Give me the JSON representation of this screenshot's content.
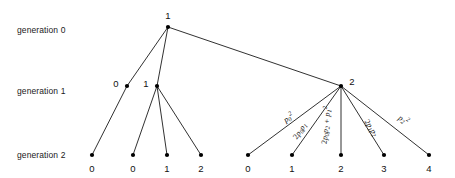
{
  "figure": {
    "background_color": "#ffffff",
    "line_color": "#1a1a1a",
    "node_color": "#000000",
    "text_color": "#111111",
    "width": 455,
    "height": 178
  },
  "generation_labels": [
    {
      "text": "generation 0",
      "x": 17,
      "y": 30
    },
    {
      "text": "generation 1",
      "x": 17,
      "y": 91
    },
    {
      "text": "generation 2",
      "x": 17,
      "y": 155
    }
  ],
  "nodes": [
    {
      "id": "g0n0",
      "label": "1",
      "x": 168,
      "y": 27,
      "label_x": 168,
      "label_y": 15,
      "generation": 0
    },
    {
      "id": "g1n0",
      "label": "0",
      "x": 127,
      "y": 86,
      "label_x": 116,
      "label_y": 83,
      "generation": 1
    },
    {
      "id": "g1n1",
      "label": "1",
      "x": 157,
      "y": 86,
      "label_x": 146,
      "label_y": 83,
      "generation": 1
    },
    {
      "id": "g1n2",
      "label": "2",
      "x": 341,
      "y": 86,
      "label_x": 352,
      "label_y": 81,
      "generation": 1
    },
    {
      "id": "g2n0",
      "label": "0",
      "x": 92,
      "y": 155,
      "label_x": 92,
      "label_y": 168,
      "generation": 2
    },
    {
      "id": "g2n1",
      "label": "0",
      "x": 133,
      "y": 155,
      "label_x": 133,
      "label_y": 168,
      "generation": 2
    },
    {
      "id": "g2n2",
      "label": "1",
      "x": 167,
      "y": 155,
      "label_x": 167,
      "label_y": 168,
      "generation": 2
    },
    {
      "id": "g2n3",
      "label": "2",
      "x": 201,
      "y": 155,
      "label_x": 201,
      "label_y": 168,
      "generation": 2
    },
    {
      "id": "g2n4",
      "label": "0",
      "x": 248,
      "y": 155,
      "label_x": 248,
      "label_y": 168,
      "generation": 2
    },
    {
      "id": "g2n5",
      "label": "1",
      "x": 292,
      "y": 155,
      "label_x": 292,
      "label_y": 168,
      "generation": 2
    },
    {
      "id": "g2n6",
      "label": "2",
      "x": 341,
      "y": 155,
      "label_x": 341,
      "label_y": 168,
      "generation": 2
    },
    {
      "id": "g2n7",
      "label": "3",
      "x": 384,
      "y": 155,
      "label_x": 384,
      "label_y": 168,
      "generation": 2
    },
    {
      "id": "g2n8",
      "label": "4",
      "x": 429,
      "y": 155,
      "label_x": 429,
      "label_y": 168,
      "generation": 2
    }
  ],
  "edges": [
    {
      "from": "g0n0",
      "to": "g1n0"
    },
    {
      "from": "g0n0",
      "to": "g1n1"
    },
    {
      "from": "g0n0",
      "to": "g1n2"
    },
    {
      "from": "g1n0",
      "to": "g2n0"
    },
    {
      "from": "g1n1",
      "to": "g2n1"
    },
    {
      "from": "g1n1",
      "to": "g2n2"
    },
    {
      "from": "g1n1",
      "to": "g2n3"
    },
    {
      "from": "g1n2",
      "to": "g2n4"
    },
    {
      "from": "g1n2",
      "to": "g2n5"
    },
    {
      "from": "g1n2",
      "to": "g2n6"
    },
    {
      "from": "g1n2",
      "to": "g2n7"
    },
    {
      "from": "g1n2",
      "to": "g2n8"
    }
  ],
  "edge_labels": [
    {
      "id": "prob-0",
      "plain": "p0^2",
      "coef": "",
      "base": "p",
      "sub": "0",
      "sup": "2",
      "x": 288,
      "y": 117,
      "rotation": -33
    },
    {
      "id": "prob-1",
      "plain": "2 p0 p1",
      "coef": "2",
      "base": "p",
      "sub": "0",
      "sup": "",
      "base2": "p",
      "sub2": "1",
      "x": 300,
      "y": 131,
      "rotation": -55
    },
    {
      "id": "prob-2",
      "plain": "2 p0 p2 + p1^2",
      "coef": "2",
      "base": "p",
      "sub": "0",
      "base2": "p",
      "sub2": "2",
      "op": "+",
      "base3": "p",
      "sub3": "1",
      "sup3": "2",
      "x": 325,
      "y": 125,
      "rotation": -84
    },
    {
      "id": "prob-3",
      "plain": "2 p1 p2",
      "coef": "2",
      "base": "p",
      "sub": "1",
      "base2": "p",
      "sub2": "2",
      "x": 371,
      "y": 128,
      "rotation": 58
    },
    {
      "id": "prob-4",
      "plain": "p2^2",
      "coef": "",
      "base": "p",
      "sub": "2",
      "sup": "2",
      "x": 404,
      "y": 119,
      "rotation": 35
    }
  ],
  "chart_data": {
    "type": "diagram",
    "diagram_kind": "branching-process-tree",
    "generations": [
      {
        "index": 0,
        "label": "generation 0",
        "node_values": [
          1
        ]
      },
      {
        "index": 1,
        "label": "generation 1",
        "node_values": [
          0,
          1,
          2
        ]
      },
      {
        "index": 2,
        "label": "generation 2",
        "node_values": [
          0,
          0,
          1,
          2,
          0,
          1,
          2,
          3,
          4
        ]
      }
    ],
    "offspring_probabilities": [
      "p0^2",
      "2 p0 p1",
      "2 p0 p2 + p1^2",
      "2 p1 p2",
      "p2^2"
    ]
  }
}
